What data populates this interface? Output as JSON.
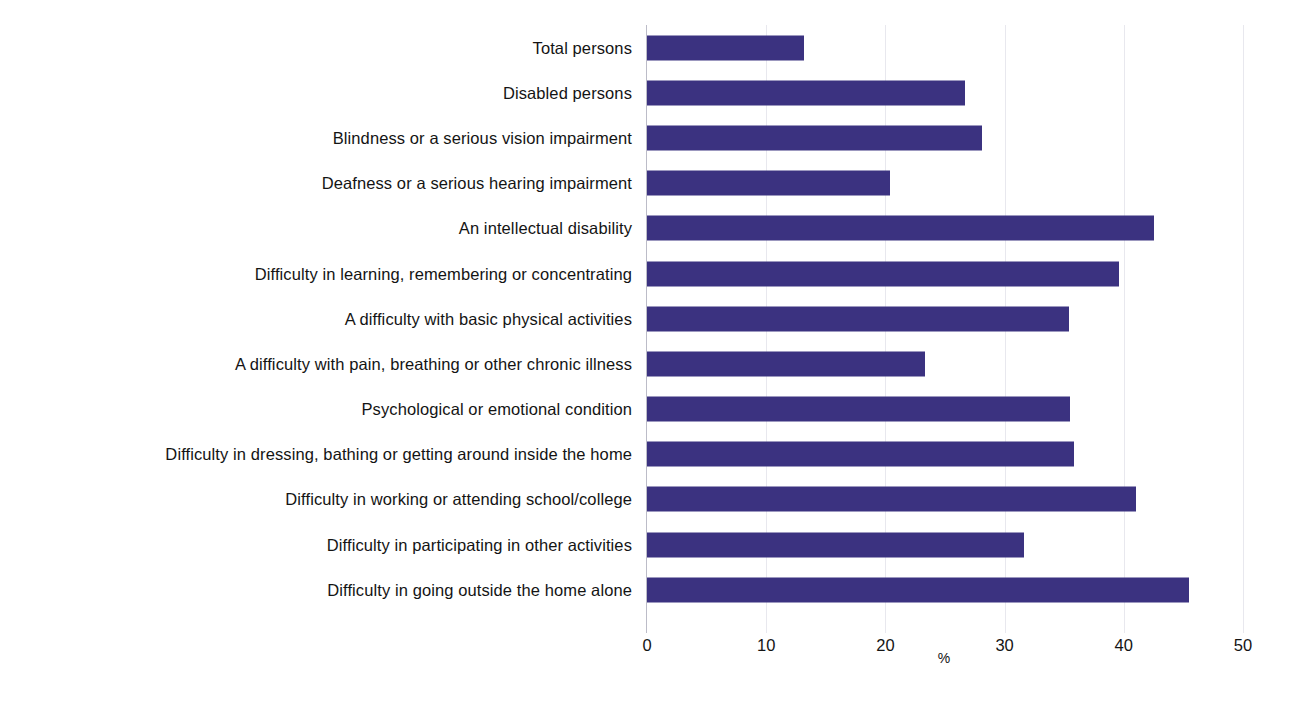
{
  "chart_data": {
    "type": "bar",
    "orientation": "horizontal",
    "title": "",
    "subtitle": "",
    "xlabel": "%",
    "ylabel": "",
    "xlim": [
      0,
      50
    ],
    "grid": true,
    "legend": null,
    "bar_color": "#3b3280",
    "axis_color": "#bcbcc8",
    "xticks": [
      0,
      10,
      20,
      30,
      40,
      50
    ],
    "xtick_labels": [
      "0",
      "10",
      "20",
      "30",
      "40",
      "50"
    ],
    "categories": [
      "Total persons",
      "Disabled persons",
      "Blindness or a serious vision impairment",
      "Deafness or a serious hearing impairment",
      "An intellectual disability",
      "Difficulty in learning, remembering or concentrating",
      "A difficulty with basic physical activities",
      "A difficulty with pain, breathing or other chronic illness",
      "Psychological or emotional condition",
      "Difficulty in dressing, bathing or getting around inside the home",
      "Difficulty in working or attending school/college",
      "Difficulty in participating in other activities",
      "Difficulty in going outside the home alone"
    ],
    "values": [
      13.2,
      26.7,
      28.1,
      20.4,
      42.5,
      39.6,
      35.4,
      23.3,
      35.5,
      35.8,
      41.0,
      31.6,
      45.5
    ]
  }
}
